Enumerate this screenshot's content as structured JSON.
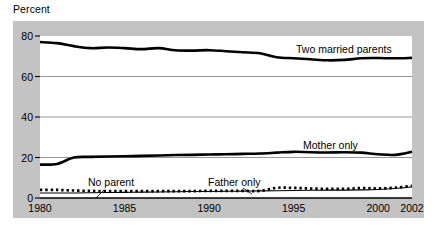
{
  "chart_data": {
    "type": "line",
    "title": "",
    "ylabel": "Percent",
    "xlabel": "",
    "ylim": [
      0,
      80
    ],
    "xlim": [
      1980,
      2002
    ],
    "yticks": [
      0,
      20,
      40,
      60,
      80
    ],
    "xticks": [
      1980,
      1985,
      1990,
      1995,
      2000,
      2002
    ],
    "grid": true,
    "legend_position": "inline-annotations",
    "x": [
      1980,
      1981,
      1982,
      1983,
      1984,
      1985,
      1986,
      1987,
      1988,
      1989,
      1990,
      1991,
      1992,
      1993,
      1994,
      1995,
      1996,
      1997,
      1998,
      1999,
      2000,
      2001,
      2002
    ],
    "series": [
      {
        "name": "Two married parents",
        "style": "solid-thick",
        "values": [
          77.0,
          76.5,
          75.0,
          74.0,
          74.3,
          74.0,
          73.5,
          74.0,
          73.0,
          72.8,
          73.0,
          72.5,
          72.0,
          71.5,
          69.5,
          69.0,
          68.5,
          68.0,
          68.2,
          69.0,
          69.1,
          69.0,
          69.2
        ]
      },
      {
        "name": "Mother only",
        "style": "solid-thick",
        "values": [
          16.5,
          16.8,
          20.0,
          20.3,
          20.5,
          20.6,
          20.8,
          21.0,
          21.2,
          21.3,
          21.5,
          21.6,
          21.8,
          22.0,
          22.4,
          22.8,
          22.6,
          22.5,
          22.6,
          22.4,
          21.6,
          21.3,
          22.8
        ]
      },
      {
        "name": "Father only",
        "style": "dotted",
        "values": [
          4.0,
          4.0,
          3.7,
          3.5,
          3.4,
          3.4,
          3.4,
          3.4,
          3.4,
          3.4,
          3.5,
          3.5,
          3.5,
          3.5,
          5.0,
          5.0,
          4.7,
          4.5,
          4.5,
          4.9,
          4.7,
          5.1,
          6.0
        ]
      },
      {
        "name": "No parent",
        "style": "solid-thin",
        "values": [
          2.5,
          2.5,
          2.5,
          2.6,
          2.7,
          2.8,
          2.9,
          3.0,
          3.1,
          3.2,
          3.2,
          3.3,
          3.4,
          3.5,
          3.6,
          3.7,
          3.8,
          3.9,
          3.9,
          4.0,
          4.2,
          4.7,
          5.5
        ]
      }
    ],
    "annotations": [
      {
        "text": "Two married parents",
        "for": "Two married parents",
        "leader": false
      },
      {
        "text": "Mother only",
        "for": "Mother only",
        "leader": false
      },
      {
        "text": "Father only",
        "for": "Father only",
        "leader": true
      },
      {
        "text": "No parent",
        "for": "No parent",
        "leader": true
      }
    ]
  },
  "colors": {
    "panel": "#c3c3c3",
    "plot": "#ffffff",
    "line": "#000000",
    "grid": "#8a8a8a",
    "text": "#000000"
  }
}
